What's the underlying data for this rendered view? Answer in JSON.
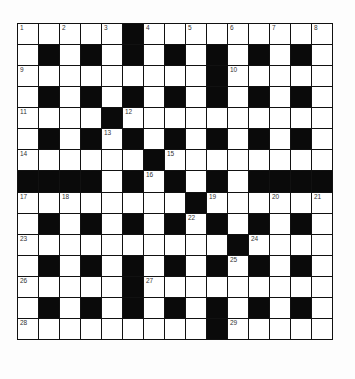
{
  "puzzle": {
    "rows": 15,
    "cols": 15,
    "grid": [
      "WWWWWBWWWWWWWWW",
      "WBWBWBWBWBWBWBW",
      "WWWWWWWWWBWWWWW",
      "WBWBWBWBWBWBWBW",
      "WWWWBWWWWWWWWWW",
      "WBWBWBWBWBWBWBW",
      "WWWWWWBWWWWWWWW",
      "BBBBWBWBWBWBBBB",
      "WWWWWWWWBWWWWWW",
      "WBWBWBWBWBWBWBW",
      "WWWWWWWWWWBWWWW",
      "WBWBWBWBWBWBWBW",
      "WWWWWBWWWWWWWWW",
      "WBWBWBWBWBWBWBW",
      "WWWWWWWWWBWWWWW"
    ],
    "numbers": [
      {
        "row": 0,
        "col": 0,
        "n": "1"
      },
      {
        "row": 0,
        "col": 2,
        "n": "2"
      },
      {
        "row": 0,
        "col": 4,
        "n": "3"
      },
      {
        "row": 0,
        "col": 6,
        "n": "4"
      },
      {
        "row": 0,
        "col": 8,
        "n": "5"
      },
      {
        "row": 0,
        "col": 10,
        "n": "6"
      },
      {
        "row": 0,
        "col": 12,
        "n": "7"
      },
      {
        "row": 0,
        "col": 14,
        "n": "8"
      },
      {
        "row": 2,
        "col": 0,
        "n": "9"
      },
      {
        "row": 2,
        "col": 10,
        "n": "10"
      },
      {
        "row": 4,
        "col": 0,
        "n": "11"
      },
      {
        "row": 4,
        "col": 5,
        "n": "12"
      },
      {
        "row": 5,
        "col": 4,
        "n": "13"
      },
      {
        "row": 6,
        "col": 0,
        "n": "14"
      },
      {
        "row": 6,
        "col": 7,
        "n": "15"
      },
      {
        "row": 7,
        "col": 6,
        "n": "16"
      },
      {
        "row": 8,
        "col": 0,
        "n": "17"
      },
      {
        "row": 8,
        "col": 2,
        "n": "18"
      },
      {
        "row": 8,
        "col": 9,
        "n": "19"
      },
      {
        "row": 8,
        "col": 12,
        "n": "20"
      },
      {
        "row": 8,
        "col": 14,
        "n": "21"
      },
      {
        "row": 9,
        "col": 8,
        "n": "22"
      },
      {
        "row": 10,
        "col": 0,
        "n": "23"
      },
      {
        "row": 10,
        "col": 11,
        "n": "24"
      },
      {
        "row": 11,
        "col": 10,
        "n": "25"
      },
      {
        "row": 12,
        "col": 0,
        "n": "26"
      },
      {
        "row": 12,
        "col": 6,
        "n": "27"
      },
      {
        "row": 14,
        "col": 0,
        "n": "28"
      },
      {
        "row": 14,
        "col": 10,
        "n": "29"
      }
    ],
    "colors": {
      "block": "#0a0a0a",
      "empty": "#ffffff",
      "border": "#111111"
    }
  }
}
